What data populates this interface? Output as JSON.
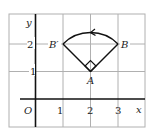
{
  "diagram": {
    "axes": {
      "x_label": "x",
      "y_label": "y",
      "origin_label": "O",
      "x_ticks": [
        "1",
        "2",
        "3"
      ],
      "y_ticks": [
        "1",
        "2"
      ]
    },
    "points": {
      "A": {
        "label": "A",
        "x": 2,
        "y": 1
      },
      "B": {
        "label": "B",
        "x": 3,
        "y": 2
      },
      "B_prime": {
        "label": "B′",
        "x": 1,
        "y": 2
      }
    },
    "rotation": {
      "center": "A",
      "angle_deg": 90,
      "direction": "counterclockwise",
      "right_angle_marker": true
    },
    "colors": {
      "grid": "#b0b0b0",
      "axes": "#111111",
      "shape": "#111111"
    }
  }
}
